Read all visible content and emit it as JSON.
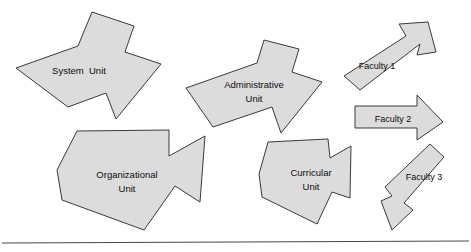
{
  "diagram": {
    "background_color": "#ffffff",
    "arrow_fill_color": "#dcdcdc",
    "arrow_stroke_color": "#3a3a3a",
    "text_color": "#0d0d0d",
    "rule_color": "#4a4a4a",
    "shapes": [
      {
        "id": "system-unit",
        "label_line1": "System  Unit",
        "label_line2": "",
        "direction": "up-right",
        "points": "16,68 78,46 92,12 134,26 125,52 161,64 116,119 106,93 68,107",
        "label_x": 79,
        "label_y": 71
      },
      {
        "id": "administrative-unit",
        "label_line1": "Administrative",
        "label_line2": "Unit",
        "direction": "up-right",
        "points": "186,88 257,63 264,40 299,49 292,72 322,82 281,133 272,107 213,127",
        "label_x": 254,
        "label_y": 90
      },
      {
        "id": "organizational-unit",
        "label_line1": "Organizational",
        "label_line2": "Unit",
        "direction": "down-right",
        "points": "77,131 169,130 169,156 205,136 200,202 175,186 144,230 62,200 57,170"
      },
      {
        "id": "curricular-unit",
        "label_line1": "Curricular",
        "label_line2": "Unit",
        "direction": "down-right",
        "points": "268,142 328,139 330,158 351,146 350,198 332,192 317,224 262,197 259,174"
      },
      {
        "id": "faculty-1",
        "label_line1": "Faculty 1",
        "label_line2": "",
        "direction": "up-right",
        "points": "344,76 406,36 399,24 428,22 436,52 417,55 420,44 360,90",
        "label_x": 377,
        "label_y": 67
      },
      {
        "id": "faculty-2",
        "label_line1": "Faculty 2",
        "label_line2": "",
        "direction": "right",
        "points": "355,106 417,106 417,95 443,122 417,140 417,128 355,128",
        "label_x": 393,
        "label_y": 120
      },
      {
        "id": "faculty-3",
        "label_line1": "Faculty 3",
        "label_line2": "",
        "direction": "down-left",
        "points": "430,144 444,157 404,203 413,210 392,230 381,201 392,196 385,187",
        "label_x": 424,
        "label_y": 178
      }
    ],
    "baseline_rule": {
      "name": "bottom-divider-line",
      "x1": 2,
      "y1": 243,
      "x2": 469,
      "y2": 241
    }
  }
}
